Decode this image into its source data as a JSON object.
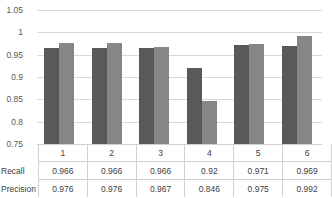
{
  "chart_data": {
    "type": "bar",
    "title": "",
    "xlabel": "",
    "ylabel": "",
    "ylim": [
      0.75,
      1.05
    ],
    "yticks": [
      "1.05",
      "1",
      "0.95",
      "0.9",
      "0.85",
      "0.8",
      "0.75"
    ],
    "ytick_values": [
      1.05,
      1,
      0.95,
      0.9,
      0.85,
      0.8,
      0.75
    ],
    "grid": true,
    "legend": "none",
    "categories": [
      "1",
      "2",
      "3",
      "4",
      "5",
      "6"
    ],
    "series": [
      {
        "name": "Recall",
        "color": "#595959",
        "values": [
          0.966,
          0.966,
          0.966,
          0.92,
          0.971,
          0.969
        ],
        "labels": [
          "0.966",
          "0.966",
          "0.966",
          "0.92",
          "0.971",
          "0.969"
        ]
      },
      {
        "name": "Precision",
        "color": "#868686",
        "values": [
          0.976,
          0.976,
          0.967,
          0.846,
          0.975,
          0.992
        ],
        "labels": [
          "0.976",
          "0.976",
          "0.967",
          "0.846",
          "0.975",
          "0.992"
        ]
      }
    ]
  },
  "table": {
    "category_row_label": "",
    "rows": [
      {
        "label": "Recall",
        "cells": [
          "0.966",
          "0.966",
          "0.966",
          "0.92",
          "0.971",
          "0.969"
        ]
      },
      {
        "label": "Precision",
        "cells": [
          "0.976",
          "0.976",
          "0.967",
          "0.846",
          "0.975",
          "0.992"
        ]
      }
    ]
  },
  "colors": {
    "recall": "#595959",
    "precision": "#868686",
    "gridline": "#d9d9d9",
    "table_border": "#d0d0d0",
    "text": "#404040"
  }
}
